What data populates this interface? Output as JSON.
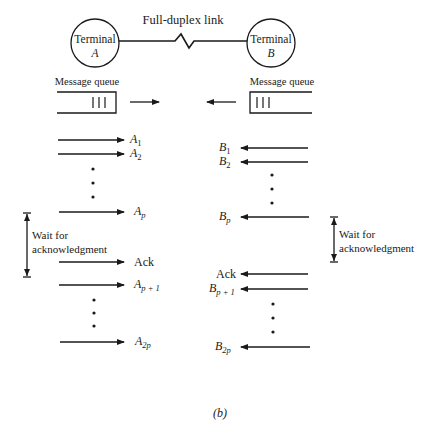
{
  "diagram": {
    "link_label": "Full-duplex link",
    "terminal_a": {
      "line1": "Terminal",
      "line2": "A"
    },
    "terminal_b": {
      "line1": "Terminal",
      "line2": "B"
    },
    "queue_a_label": "Message queue",
    "queue_b_label": "Message queue",
    "wait_left": {
      "line1": "Wait for",
      "line2": "acknowledgment"
    },
    "wait_right": {
      "line1": "Wait for",
      "line2": "acknowledgment"
    },
    "left_messages": [
      {
        "base": "A",
        "sub": "1"
      },
      {
        "base": "A",
        "sub": "2"
      },
      {
        "base": "A",
        "sub": "p"
      },
      {
        "base": "Ack",
        "sub": ""
      },
      {
        "base": "A",
        "sub": "p + 1"
      },
      {
        "base": "A",
        "sub": "2p"
      }
    ],
    "right_messages": [
      {
        "base": "B",
        "sub": "1"
      },
      {
        "base": "B",
        "sub": "2"
      },
      {
        "base": "B",
        "sub": "p"
      },
      {
        "base": "Ack",
        "sub": ""
      },
      {
        "base": "B",
        "sub": "p + 1"
      },
      {
        "base": "B",
        "sub": "2p"
      }
    ],
    "caption": "(b)"
  }
}
